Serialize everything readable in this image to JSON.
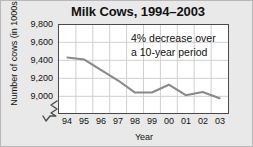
{
  "chart_data": {
    "type": "line",
    "title": "Milk Cows, 1994–2003",
    "xlabel": "Year",
    "ylabel": "Number of cows (in 1000s)",
    "categories": [
      "94",
      "95",
      "96",
      "97",
      "98",
      "99",
      "00",
      "01",
      "02",
      "03"
    ],
    "x_full_years": [
      1994,
      1995,
      1996,
      1997,
      1998,
      1999,
      2000,
      2001,
      2002,
      2003
    ],
    "values": [
      9490,
      9470,
      9370,
      9270,
      9155,
      9155,
      9230,
      9130,
      9160,
      9100
    ],
    "series": [
      {
        "name": "Milk cows",
        "values": [
          9490,
          9470,
          9370,
          9270,
          9155,
          9155,
          9230,
          9130,
          9160,
          9100
        ]
      }
    ],
    "ylim": [
      8960,
      9800
    ],
    "yticks": [
      9000,
      9200,
      9400,
      9600,
      9800
    ],
    "ytick_labels": [
      "9,000",
      "9,200",
      "9,400",
      "9,600",
      "9,800"
    ],
    "grid": true,
    "legend": "none",
    "y_axis_break": true,
    "line_color": "#8a8a8a",
    "grid_color": "#cfcfcf",
    "plot_background": "#ffffff",
    "figure_background": "#e9e9e9",
    "annotations": [
      {
        "name": "decrease-note",
        "line1": "4% decrease over",
        "line2": "a 10-year period"
      }
    ]
  }
}
